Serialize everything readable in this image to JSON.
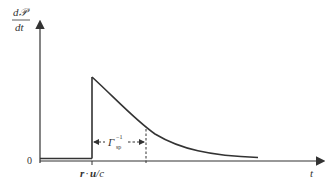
{
  "diagram": {
    "type": "pulse-decay-plot",
    "y_axis_label_num": "d𝒫",
    "y_axis_label_den": "dt",
    "x_axis_label": "t",
    "origin_label": "0",
    "onset_label_r": "r",
    "onset_label_dot": "·",
    "onset_label_u": "u",
    "onset_label_c": "/c",
    "decay_label": "Γ",
    "decay_label_sup": "−1",
    "decay_label_sub": "sp",
    "colors": {
      "line": "#333333",
      "background": "#ffffff"
    }
  }
}
